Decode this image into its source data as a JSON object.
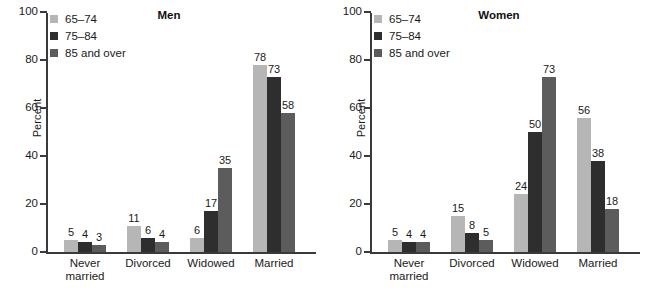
{
  "chart_data": [
    {
      "type": "bar",
      "title": "Men",
      "xlabel": "",
      "ylabel": "Percent",
      "ylim": [
        0,
        100
      ],
      "yticks": [
        0,
        20,
        40,
        60,
        80,
        100
      ],
      "grid": false,
      "legend_position": "top-left",
      "categories": [
        "Never married",
        "Divorced",
        "Widowed",
        "Married"
      ],
      "series": [
        {
          "name": "65–74",
          "color": "#b6b6b6",
          "values": [
            5,
            11,
            6,
            78
          ]
        },
        {
          "name": "75–84",
          "color": "#2e2e2e",
          "values": [
            4,
            6,
            17,
            73
          ]
        },
        {
          "name": "85 and over",
          "color": "#5c5c5c",
          "values": [
            3,
            4,
            35,
            58
          ]
        }
      ]
    },
    {
      "type": "bar",
      "title": "Women",
      "xlabel": "",
      "ylabel": "Percent",
      "ylim": [
        0,
        100
      ],
      "yticks": [
        0,
        20,
        40,
        60,
        80,
        100
      ],
      "grid": false,
      "legend_position": "top-left",
      "categories": [
        "Never married",
        "Divorced",
        "Widowed",
        "Married"
      ],
      "series": [
        {
          "name": "65–74",
          "color": "#b6b6b6",
          "values": [
            5,
            15,
            24,
            56
          ]
        },
        {
          "name": "75–84",
          "color": "#2e2e2e",
          "values": [
            4,
            8,
            50,
            38
          ]
        },
        {
          "name": "85 and over",
          "color": "#5c5c5c",
          "values": [
            4,
            5,
            73,
            18
          ]
        }
      ]
    }
  ],
  "panels": [
    {
      "id": "men",
      "title": "Men",
      "y_axis_label": "Percent",
      "y_tick_labels": [
        "100",
        "80",
        "60",
        "40",
        "20",
        "0"
      ],
      "x_tick_labels": [
        {
          "line1": "Never",
          "line2": "married"
        },
        {
          "line1": "Divorced",
          "line2": ""
        },
        {
          "line1": "Widowed",
          "line2": ""
        },
        {
          "line1": "Married",
          "line2": ""
        }
      ],
      "legend": [
        {
          "label": "65–74",
          "color": "#b6b6b6"
        },
        {
          "label": "75–84",
          "color": "#2e2e2e"
        },
        {
          "label": "85 and over",
          "color": "#5c5c5c"
        }
      ],
      "groups": [
        {
          "category": "Never married",
          "bars": [
            {
              "series": "65–74",
              "value": 5,
              "label": "5",
              "color": "#b6b6b6"
            },
            {
              "series": "75–84",
              "value": 4,
              "label": "4",
              "color": "#2e2e2e"
            },
            {
              "series": "85 and over",
              "value": 3,
              "label": "3",
              "color": "#5c5c5c"
            }
          ]
        },
        {
          "category": "Divorced",
          "bars": [
            {
              "series": "65–74",
              "value": 11,
              "label": "11",
              "color": "#b6b6b6"
            },
            {
              "series": "75–84",
              "value": 6,
              "label": "6",
              "color": "#2e2e2e"
            },
            {
              "series": "85 and over",
              "value": 4,
              "label": "4",
              "color": "#5c5c5c"
            }
          ]
        },
        {
          "category": "Widowed",
          "bars": [
            {
              "series": "65–74",
              "value": 6,
              "label": "6",
              "color": "#b6b6b6"
            },
            {
              "series": "75–84",
              "value": 17,
              "label": "17",
              "color": "#2e2e2e"
            },
            {
              "series": "85 and over",
              "value": 35,
              "label": "35",
              "color": "#5c5c5c"
            }
          ]
        },
        {
          "category": "Married",
          "bars": [
            {
              "series": "65–74",
              "value": 78,
              "label": "78",
              "color": "#b6b6b6"
            },
            {
              "series": "75–84",
              "value": 73,
              "label": "73",
              "color": "#2e2e2e"
            },
            {
              "series": "85 and over",
              "value": 58,
              "label": "58",
              "color": "#5c5c5c"
            }
          ]
        }
      ]
    },
    {
      "id": "women",
      "title": "Women",
      "y_axis_label": "Percent",
      "y_tick_labels": [
        "100",
        "80",
        "60",
        "40",
        "20",
        "0"
      ],
      "x_tick_labels": [
        {
          "line1": "Never",
          "line2": "married"
        },
        {
          "line1": "Divorced",
          "line2": ""
        },
        {
          "line1": "Widowed",
          "line2": ""
        },
        {
          "line1": "Married",
          "line2": ""
        }
      ],
      "legend": [
        {
          "label": "65–74",
          "color": "#b6b6b6"
        },
        {
          "label": "75–84",
          "color": "#2e2e2e"
        },
        {
          "label": "85 and over",
          "color": "#5c5c5c"
        }
      ],
      "groups": [
        {
          "category": "Never married",
          "bars": [
            {
              "series": "65–74",
              "value": 5,
              "label": "5",
              "color": "#b6b6b6"
            },
            {
              "series": "75–84",
              "value": 4,
              "label": "4",
              "color": "#2e2e2e"
            },
            {
              "series": "85 and over",
              "value": 4,
              "label": "4",
              "color": "#5c5c5c"
            }
          ]
        },
        {
          "category": "Divorced",
          "bars": [
            {
              "series": "65–74",
              "value": 15,
              "label": "15",
              "color": "#b6b6b6"
            },
            {
              "series": "75–84",
              "value": 8,
              "label": "8",
              "color": "#2e2e2e"
            },
            {
              "series": "85 and over",
              "value": 5,
              "label": "5",
              "color": "#5c5c5c"
            }
          ]
        },
        {
          "category": "Widowed",
          "bars": [
            {
              "series": "65–74",
              "value": 24,
              "label": "24",
              "color": "#b6b6b6"
            },
            {
              "series": "75–84",
              "value": 50,
              "label": "50",
              "color": "#2e2e2e"
            },
            {
              "series": "85 and over",
              "value": 73,
              "label": "73",
              "color": "#5c5c5c"
            }
          ]
        },
        {
          "category": "Married",
          "bars": [
            {
              "series": "65–74",
              "value": 56,
              "label": "56",
              "color": "#b6b6b6"
            },
            {
              "series": "75–84",
              "value": 38,
              "label": "38",
              "color": "#2e2e2e"
            },
            {
              "series": "85 and over",
              "value": 18,
              "label": "18",
              "color": "#5c5c5c"
            }
          ]
        }
      ]
    }
  ]
}
